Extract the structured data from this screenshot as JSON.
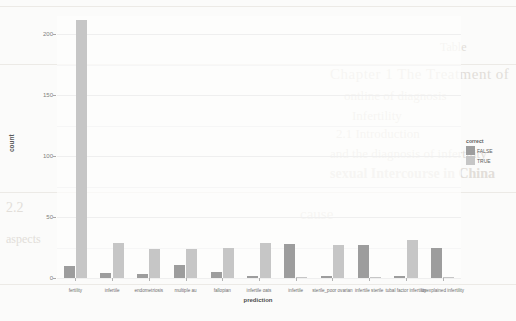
{
  "chart_data": {
    "type": "bar",
    "title": "",
    "xlabel": "prediction",
    "ylabel": "count",
    "ylim": [
      0,
      215
    ],
    "yticks": [
      0,
      50,
      100,
      150,
      200
    ],
    "grid": true,
    "legend_position": "right",
    "legend_title": "correct",
    "categories": [
      "fertility",
      "infertile",
      "endometriosis",
      "multiple au",
      "fallopian",
      "infertile oats",
      "infertile",
      "sterile_poor ovarian",
      "infertile sterile",
      "tubal factor infertility",
      "unexplained infertility"
    ],
    "series": [
      {
        "name": "FALSE",
        "color": "#9d9d9d",
        "values": [
          10,
          4,
          3,
          11,
          5,
          2,
          28,
          2,
          27,
          2,
          25
        ]
      },
      {
        "name": "TRUE",
        "color": "#c6c6c6",
        "values": [
          212,
          29,
          24,
          24,
          25,
          29,
          1,
          27,
          1,
          31,
          0
        ]
      }
    ]
  },
  "legend": {
    "title": "correct",
    "items": [
      {
        "label": "FALSE",
        "color": "#9d9d9d"
      },
      {
        "label": "TRUE",
        "color": "#c6c6c6"
      }
    ]
  },
  "bleed_text": {
    "l1": "Chapter 1  The Treatment of",
    "l2": "ontline of diagnosis",
    "l3": "Infertility",
    "l4": "2.1 Introduction",
    "l5": "and the diagnosis of infertility",
    "l6": "sexual Intercourse in China",
    "l7": "cause",
    "l8": "2.2",
    "l9": "aspects",
    "l10": "Table"
  }
}
